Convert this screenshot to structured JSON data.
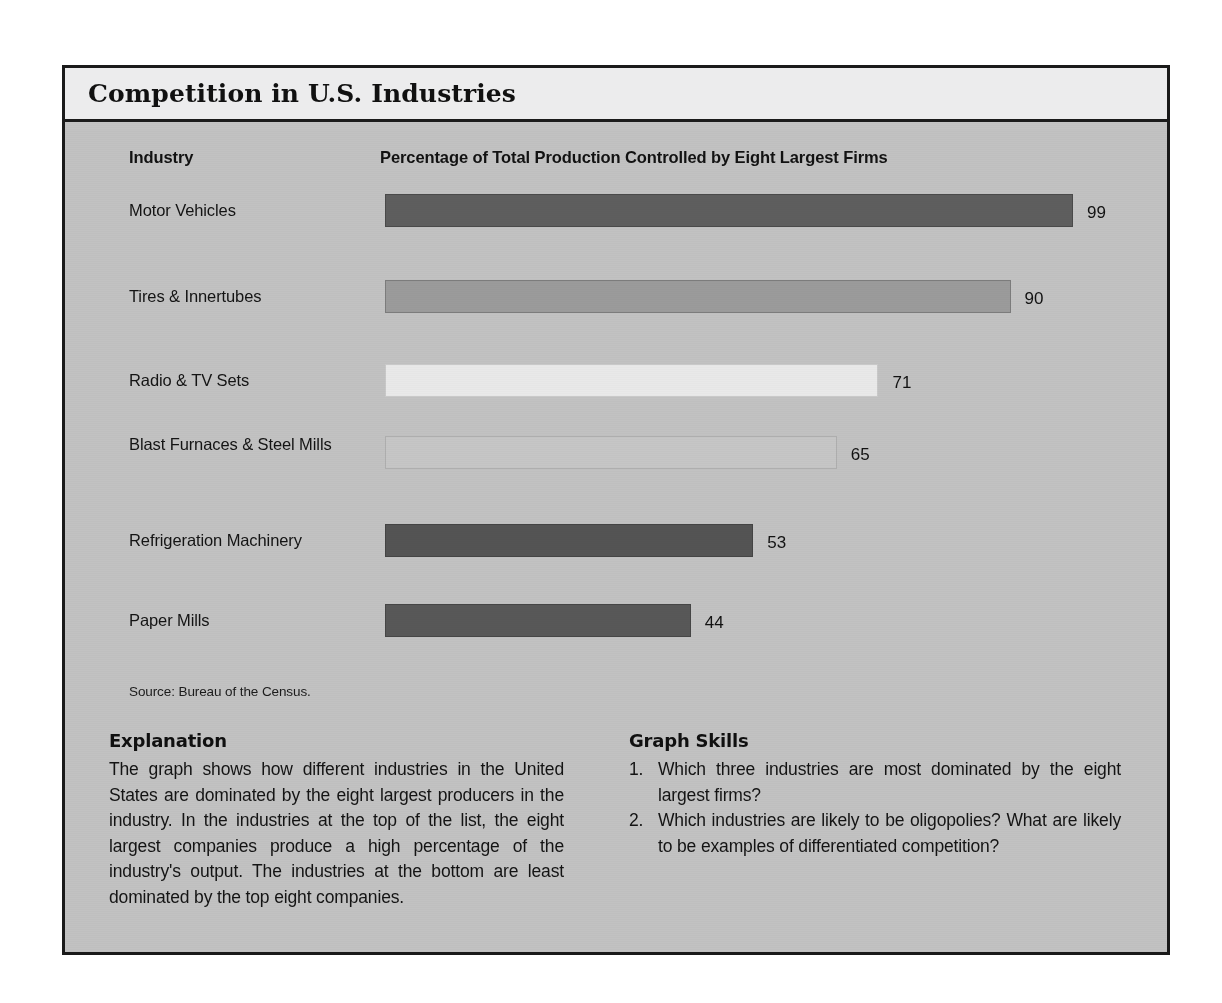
{
  "figure": {
    "title": "Competition in U.S. Industries",
    "headers": {
      "industry": "Industry",
      "percentage": "Percentage of Total Production Controlled by Eight Largest Firms"
    },
    "source": "Source: Bureau of the Census."
  },
  "chart_data": {
    "type": "bar",
    "orientation": "horizontal",
    "title": "Competition in U.S. Industries",
    "xlabel": "Percentage of Total Production Controlled by Eight Largest Firms",
    "ylabel": "Industry",
    "xlim": [
      0,
      100
    ],
    "grid": false,
    "legend": null,
    "source": "Source: Bureau of the Census.",
    "categories": [
      "Motor Vehicles",
      "Tires & Innertubes",
      "Radio & TV Sets",
      "Blast Furnaces & Steel Mills",
      "Refrigeration Machinery",
      "Paper Mills"
    ],
    "values": [
      99,
      90,
      71,
      65,
      53,
      44
    ],
    "bar_colors": [
      "#5e5e5e",
      "#9b9b9b",
      "#e9e9e9",
      "#c6c6c6",
      "#545454",
      "#585858"
    ],
    "bars": [
      {
        "label": "Motor Vehicles",
        "value": 99,
        "value_text": "99",
        "color": "#5e5e5e",
        "border": "#4a4a4a"
      },
      {
        "label": "Tires & Innertubes",
        "value": 90,
        "value_text": "90",
        "color": "#9b9b9b",
        "border": "#7c7c7c"
      },
      {
        "label": "Radio & TV Sets",
        "value": 71,
        "value_text": "71",
        "color": "#e9e9e9",
        "border": "#c9c9c9"
      },
      {
        "label": "Blast Furnaces & Steel Mills",
        "value": 65,
        "value_text": "65",
        "color": "#c6c6c6",
        "border": "#aeaeae"
      },
      {
        "label": "Refrigeration Machinery",
        "value": 53,
        "value_text": "53",
        "color": "#545454",
        "border": "#444444"
      },
      {
        "label": "Paper Mills",
        "value": 44,
        "value_text": "44",
        "color": "#585858",
        "border": "#464646"
      }
    ]
  },
  "explanation": {
    "heading": "Explanation",
    "body": "The graph shows how different industries in the United States are dominated by the eight largest producers in the industry. In the industries at the top of the list, the eight largest companies produce a high percentage of the industry's output. The industries at the bottom are least dominated by the top eight companies."
  },
  "graph_skills": {
    "heading": "Graph Skills",
    "questions": [
      {
        "number": "1.",
        "text": "Which three industries are most dominated by the eight largest firms?"
      },
      {
        "number": "2.",
        "text": "Which industries are likely to be oligopolies? What are likely to be examples of differentiated competition?"
      }
    ]
  },
  "colors": {
    "page_background": "#ffffff",
    "panel_background": "#c2c2c2",
    "title_background": "#ececed",
    "frame_border": "#1a1a1a",
    "text": "#141414"
  }
}
